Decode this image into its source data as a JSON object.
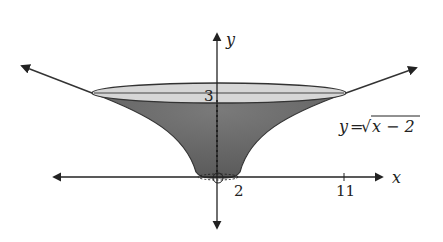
{
  "figure": {
    "equation_label": "y=√x − 2",
    "equation": {
      "lhs": "y",
      "eq": "=",
      "radical": "√",
      "radicand": "x − 2"
    },
    "axes": {
      "x_label": "x",
      "y_label": "y",
      "x_ticks": [
        {
          "value": 2,
          "label": "2"
        },
        {
          "value": 11,
          "label": "11"
        }
      ],
      "y_ticks": [
        {
          "value": 3,
          "label": "3"
        }
      ]
    },
    "colors": {
      "surface_dark": "#6a6a6a",
      "top_ellipse_fill": "#d4d4d4",
      "curve_stroke": "#333333",
      "axis_stroke": "#222222"
    }
  }
}
